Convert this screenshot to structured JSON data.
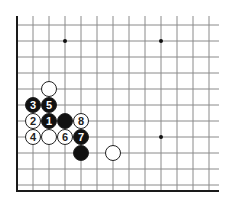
{
  "diagram": {
    "type": "go-board-corner",
    "grid": {
      "x0": 17,
      "y0": 25,
      "spacing": 16,
      "cols": 13,
      "rows": 11,
      "line_color": "#8a8a8a",
      "edge_color": "#1a1a1a",
      "right_extend": 219,
      "top_extend": 16,
      "bottom_edge_y": 191
    },
    "star_points": [
      {
        "col": 3,
        "row": 1
      },
      {
        "col": 9,
        "row": 1
      },
      {
        "col": 9,
        "row": 7
      }
    ],
    "stones": [
      {
        "color": "white",
        "col": 2,
        "row": 4,
        "label": ""
      },
      {
        "color": "black",
        "col": 1,
        "row": 5,
        "label": "3"
      },
      {
        "color": "black",
        "col": 2,
        "row": 5,
        "label": "5"
      },
      {
        "color": "white",
        "col": 1,
        "row": 6,
        "label": "2"
      },
      {
        "color": "black",
        "col": 2,
        "row": 6,
        "label": "1"
      },
      {
        "color": "black",
        "col": 3,
        "row": 6,
        "label": ""
      },
      {
        "color": "white",
        "col": 4,
        "row": 6,
        "label": "8"
      },
      {
        "color": "white",
        "col": 1,
        "row": 7,
        "label": "4"
      },
      {
        "color": "white",
        "col": 2,
        "row": 7,
        "label": ""
      },
      {
        "color": "white",
        "col": 3,
        "row": 7,
        "label": "6"
      },
      {
        "color": "black",
        "col": 4,
        "row": 7,
        "label": "7"
      },
      {
        "color": "black",
        "col": 4,
        "row": 8,
        "label": ""
      },
      {
        "color": "white",
        "col": 6,
        "row": 8,
        "label": ""
      }
    ]
  }
}
